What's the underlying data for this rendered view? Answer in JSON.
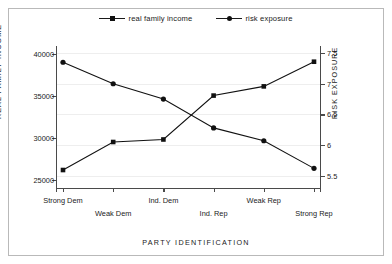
{
  "legend": {
    "entries": [
      {
        "label": "real family income",
        "marker": "square-marker-icon"
      },
      {
        "label": "risk exposure",
        "marker": "circle-marker-icon"
      }
    ]
  },
  "chart_data": {
    "type": "line",
    "title": "",
    "xlabel": "PARTY IDENTIFICATION",
    "categories": [
      "Strong Dem",
      "Weak Dem",
      "Ind. Dem",
      "Ind. Rep",
      "Weak Rep",
      "Strong Rep"
    ],
    "grid": true,
    "legend_position": "top-center",
    "axes": {
      "left": {
        "label": "REAL FAMILY INCOME",
        "ticks": [
          "25000",
          "30000",
          "35000",
          "40000"
        ],
        "tick_values": [
          25000,
          30000,
          35000,
          40000
        ],
        "ylim": [
          24000,
          40500
        ]
      },
      "right": {
        "label": "RISK EXPOSURE",
        "ticks": [
          "5.5",
          "6",
          "6.5",
          "7",
          "7.5"
        ],
        "tick_values": [
          5.5,
          6,
          6.5,
          7,
          7.5
        ],
        "ylim": [
          5.3,
          7.55
        ]
      }
    },
    "series": [
      {
        "name": "real family income",
        "axis": "left",
        "marker": "square",
        "values": [
          26150,
          29500,
          29800,
          35050,
          36150,
          39100
        ]
      },
      {
        "name": "risk exposure",
        "axis": "right",
        "marker": "circle",
        "values": [
          7.35,
          7.0,
          6.75,
          6.28,
          6.07,
          5.62
        ]
      }
    ]
  },
  "colors": {
    "line": "#111111",
    "axis": "#4a4a4a",
    "grid": "#eeeeee",
    "border": "#b9b9b9",
    "background": "#ffffff",
    "text": "#1a1a1a"
  }
}
